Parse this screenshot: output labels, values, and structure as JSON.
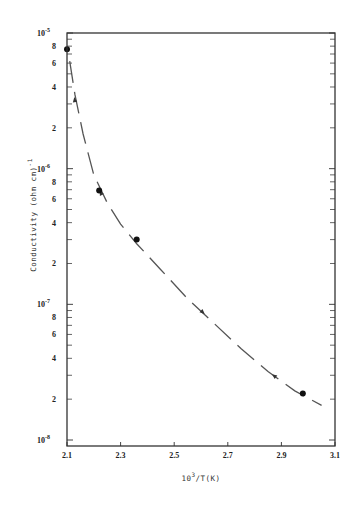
{
  "chart_data": {
    "type": "line",
    "title": "",
    "xlabel": "10^3/T(K)",
    "xlabel_main": "10",
    "xlabel_sup": "3",
    "xlabel_rest": "/T(K)",
    "ylabel": "Conductivity (ohm cm)^-1",
    "ylabel_main": "Conductivity (ohm cm)",
    "ylabel_sup": "-1",
    "xlim": [
      2.1,
      3.1
    ],
    "ylim": [
      1e-08,
      1e-05
    ],
    "yscale": "log",
    "grid": false,
    "legend": null,
    "x_ticks": [
      {
        "value": 2.1,
        "label": "2.1"
      },
      {
        "value": 2.3,
        "label": "2.3"
      },
      {
        "value": 2.5,
        "label": "2.5"
      },
      {
        "value": 2.7,
        "label": "2.7"
      },
      {
        "value": 2.9,
        "label": "2.9"
      },
      {
        "value": 3.1,
        "label": "3.1"
      }
    ],
    "y_decade_labels": [
      {
        "exp": -5,
        "base": "10",
        "sup": "-5"
      },
      {
        "exp": -6,
        "base": "10",
        "sup": "-6"
      },
      {
        "exp": -7,
        "base": "10",
        "sup": "-7"
      },
      {
        "exp": -8,
        "base": "10",
        "sup": "-8"
      }
    ],
    "y_minor_labels": [
      "8",
      "6",
      "4",
      "2"
    ],
    "series": [
      {
        "name": "measured points",
        "style": "markers",
        "x": [
          2.1,
          2.22,
          2.36,
          2.98
        ],
        "y": [
          7.6e-06,
          6.9e-07,
          3e-07,
          2.2e-08
        ]
      },
      {
        "name": "heating/cooling curve",
        "style": "dashed-with-arrows",
        "x": [
          2.11,
          2.13,
          2.16,
          2.2,
          2.25,
          2.3,
          2.36,
          2.45,
          2.55,
          2.65,
          2.75,
          2.85,
          2.95,
          3.05
        ],
        "y": [
          6.2e-06,
          3.5e-06,
          1.8e-06,
          9e-07,
          5.6e-07,
          3.9e-07,
          2.8e-07,
          1.8e-07,
          1.1e-07,
          7.2e-08,
          4.7e-08,
          3.2e-08,
          2.3e-08,
          1.8e-08
        ]
      }
    ],
    "arrows": [
      {
        "x": 2.13,
        "y": 3.1e-06,
        "direction": "up"
      },
      {
        "x": 2.23,
        "y": 6.4e-07,
        "direction": "up"
      },
      {
        "x": 2.6,
        "y": 9e-08,
        "direction": "down"
      },
      {
        "x": 2.88,
        "y": 2.9e-08,
        "direction": "up"
      }
    ]
  }
}
